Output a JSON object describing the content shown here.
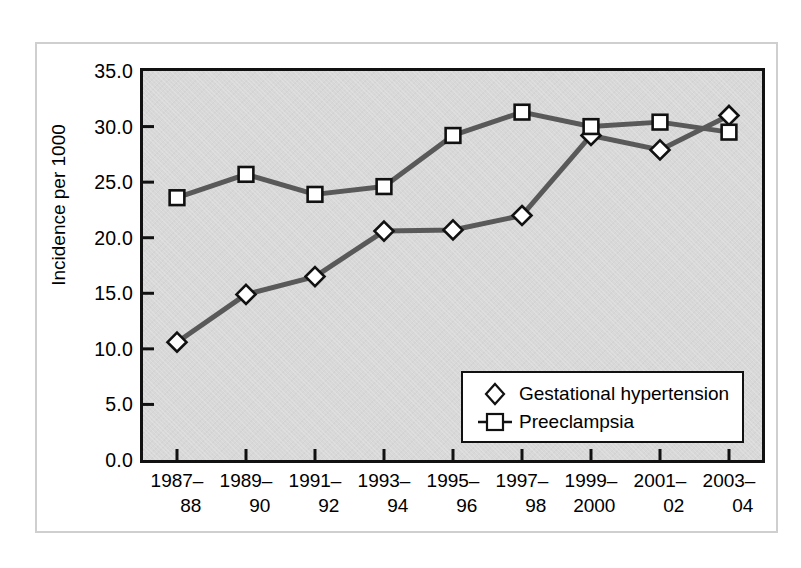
{
  "chart_data": {
    "type": "line",
    "title": "",
    "xlabel": "",
    "ylabel": "Incidence per 1000",
    "ylim": [
      0.0,
      35.0
    ],
    "ytick_labels": [
      "35.0",
      "30.0",
      "25.0",
      "20.0",
      "15.0",
      "10.0",
      "5.0",
      "0.0"
    ],
    "ytick_values": [
      35.0,
      30.0,
      25.0,
      20.0,
      15.0,
      10.0,
      5.0,
      0.0
    ],
    "grid": false,
    "legend_position": "lower-right",
    "categories": [
      "1987–88",
      "1989–90",
      "1991–92",
      "1993–94",
      "1995–96",
      "1997–98",
      "1999–2000",
      "2001–02",
      "2003–04"
    ],
    "category_lines": [
      [
        "1987–",
        "88"
      ],
      [
        "1989–",
        "90"
      ],
      [
        "1991–",
        "92"
      ],
      [
        "1993–",
        "94"
      ],
      [
        "1995–",
        "96"
      ],
      [
        "1997–",
        "98"
      ],
      [
        "1999–",
        "2000"
      ],
      [
        "2001–",
        "02"
      ],
      [
        "2003–",
        "04"
      ]
    ],
    "series": [
      {
        "name": "Gestational hypertension",
        "marker": "diamond",
        "values": [
          10.6,
          14.9,
          16.5,
          20.6,
          20.7,
          22.0,
          29.2,
          27.9,
          31.0
        ]
      },
      {
        "name": "Preeclampsia",
        "marker": "square",
        "values": [
          23.6,
          25.7,
          23.9,
          24.6,
          29.2,
          31.3,
          30.0,
          30.4,
          29.5
        ]
      }
    ],
    "colors": {
      "line": "#595959",
      "marker_fill": "#ffffff",
      "marker_stroke": "#111111",
      "plot_background": "#d8d8d8",
      "frame": "#111111",
      "figure_border": "#cfcfcf"
    }
  },
  "legend": {
    "items": [
      {
        "label": "Gestational hypertension",
        "marker": "diamond-marker-icon"
      },
      {
        "label": "Preeclampsia",
        "marker": "square-marker-icon"
      }
    ]
  }
}
